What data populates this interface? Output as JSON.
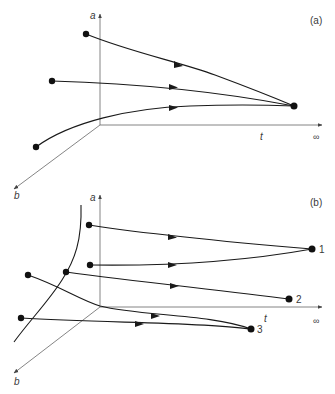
{
  "panels": [
    {
      "id": "a",
      "label": "(a)",
      "axes": {
        "vertical": "a",
        "horizontal": "t",
        "depth": "b",
        "horizontal_end": "∞"
      },
      "description": "Three trajectories converge to a single stable point at t → ∞"
    },
    {
      "id": "b",
      "label": "(b)",
      "axes": {
        "vertical": "a",
        "horizontal": "t",
        "depth": "b",
        "horizontal_end": "∞"
      },
      "endpoints": [
        "1",
        "2",
        "3"
      ],
      "description": "Trajectories from different starting points converge to distinct endpoints 1, 2, 3; a separatrix curve divides the initial states"
    }
  ],
  "colors": {
    "line": "#1a1a1a",
    "axis": "#555555",
    "text": "#3a3a3a"
  }
}
